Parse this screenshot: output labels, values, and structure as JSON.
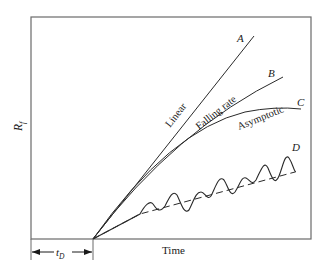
{
  "diagram": {
    "y_axis_label": "R",
    "y_axis_label_sub": "f",
    "x_axis_label": "Time",
    "delay_label": "t",
    "delay_label_sub": "D",
    "curves": [
      {
        "letter": "A",
        "label": "Linear"
      },
      {
        "letter": "B",
        "label": "Falling rate"
      },
      {
        "letter": "C",
        "label": "Asymptotic"
      },
      {
        "letter": "D",
        "label": ""
      }
    ],
    "colors": {
      "line": "#2a2a2a",
      "frame": "#6a6a6a"
    }
  }
}
